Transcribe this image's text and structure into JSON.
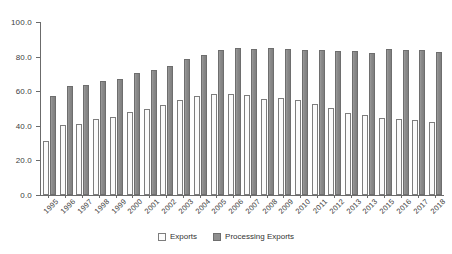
{
  "chart_data": {
    "type": "bar",
    "title": "",
    "xlabel": "",
    "ylabel": "",
    "ylim": [
      0,
      100
    ],
    "yticks": [
      "0.0",
      "20.0",
      "40.0",
      "60.0",
      "80.0",
      "100.0"
    ],
    "ytick_values": [
      0,
      20,
      40,
      60,
      80,
      100
    ],
    "grid": false,
    "legend_position": "bottom-center",
    "categories": [
      "1995",
      "1996",
      "1997",
      "1998",
      "1999",
      "2000",
      "2001",
      "2002",
      "2003",
      "2004",
      "2005",
      "2006",
      "2007",
      "2008",
      "2009",
      "2010",
      "2011",
      "2012",
      "2013",
      "2013",
      "2015",
      "2016",
      "2017",
      "2018"
    ],
    "series": [
      {
        "name": "Exports",
        "values": [
          31.5,
          40.5,
          41.0,
          44.0,
          45.3,
          48.2,
          49.8,
          52.2,
          55.0,
          57.2,
          58.4,
          58.4,
          57.6,
          55.7,
          56.1,
          54.9,
          52.6,
          50.3,
          47.6,
          46.2,
          44.8,
          44.1,
          43.6,
          42.4
        ]
      },
      {
        "name": "Processing Exports",
        "values": [
          57.0,
          62.8,
          63.8,
          66.0,
          67.1,
          70.7,
          72.4,
          74.8,
          78.6,
          81.2,
          83.6,
          84.7,
          84.6,
          84.9,
          84.3,
          84.1,
          84.0,
          83.4,
          83.5,
          82.0,
          84.2,
          83.7,
          84.1,
          82.7
        ]
      }
    ]
  },
  "legend": {
    "items": [
      {
        "label": "Exports",
        "swatch": "dotted-light-swatch",
        "color": "#fcfcfc"
      },
      {
        "label": "Processing Exports",
        "swatch": "solid-gray-swatch",
        "color": "#8f8f8f"
      }
    ]
  },
  "axis": {
    "line_color": "#6b6b6b",
    "label_color": "#404040"
  }
}
